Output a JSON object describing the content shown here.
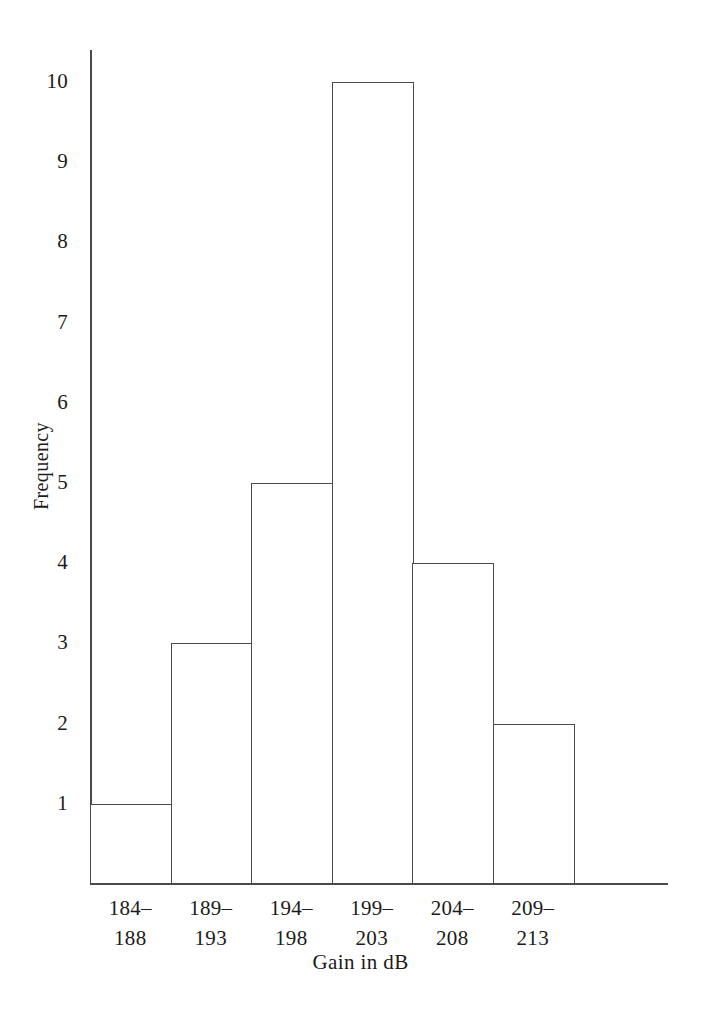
{
  "chart_data": {
    "type": "bar",
    "title": "",
    "subtitle": "",
    "xlabel": "Gain in dB",
    "ylabel": "Frequency",
    "categories": [
      "184–188",
      "189–193",
      "194–198",
      "199–203",
      "204–208",
      "209–213"
    ],
    "values": [
      1,
      3,
      5,
      10,
      4,
      2
    ],
    "series": [
      {
        "name": "Frequency",
        "values": [
          1,
          3,
          5,
          10,
          4,
          2
        ]
      }
    ],
    "ylim": [
      0,
      10
    ],
    "yticks": [
      1,
      2,
      3,
      4,
      5,
      6,
      7,
      8,
      9,
      10
    ],
    "ytick_labels": [
      "1",
      "2",
      "3",
      "4",
      "5",
      "6",
      "7",
      "8",
      "9",
      "10"
    ],
    "grid": false,
    "legend": false,
    "legend_position": "none",
    "bar_style": "outlined-adjacent",
    "bar_fill_color": "#ffffff",
    "bar_edge_color": "#4a4a4a",
    "axis_color": "#4a4a4a",
    "background_color": "#ffffff",
    "text_color": "#1b1b1b"
  }
}
